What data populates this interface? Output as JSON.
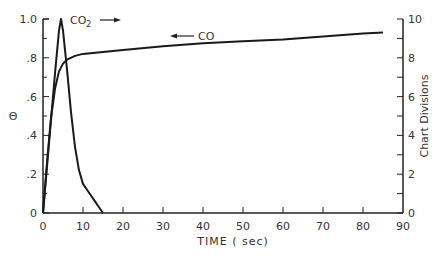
{
  "chart_data": {
    "type": "line",
    "title": "",
    "xlabel": "TIME ( sec)",
    "ylabel": "Θ",
    "ylabel_right": "Chart Divisions",
    "xlim": [
      0,
      90
    ],
    "ylim": [
      0,
      1.0
    ],
    "ylim_right": [
      0,
      10
    ],
    "x_ticks": [
      0,
      10,
      20,
      30,
      40,
      50,
      60,
      70,
      80,
      90
    ],
    "y_ticks": [
      "0",
      ".2",
      ".4",
      ".6",
      ".8",
      "1.0"
    ],
    "y_ticks_right": [
      "0",
      "2",
      "4",
      "6",
      "8",
      "10"
    ],
    "grid": false,
    "series": [
      {
        "name": "CO2",
        "axis": "left",
        "annotation": "CO2 →",
        "x": [
          0,
          1,
          2,
          3,
          4,
          4.5,
          5,
          6,
          7,
          8,
          9,
          10,
          11,
          12,
          13,
          14,
          15
        ],
        "y": [
          0,
          0.24,
          0.48,
          0.72,
          0.94,
          1.0,
          0.94,
          0.74,
          0.52,
          0.34,
          0.22,
          0.15,
          0.12,
          0.09,
          0.06,
          0.03,
          0.0
        ]
      },
      {
        "name": "CO",
        "axis": "right",
        "annotation": "← CO",
        "x": [
          0,
          1,
          2,
          3,
          4,
          5,
          6,
          8,
          10,
          15,
          20,
          30,
          40,
          50,
          60,
          70,
          80,
          85
        ],
        "y": [
          0,
          2.6,
          4.9,
          6.4,
          7.3,
          7.7,
          7.9,
          8.1,
          8.2,
          8.3,
          8.4,
          8.6,
          8.75,
          8.85,
          8.95,
          9.1,
          9.25,
          9.3
        ]
      }
    ]
  },
  "labels": {
    "co2": "CO",
    "co2_sub": "2",
    "co": "CO"
  }
}
